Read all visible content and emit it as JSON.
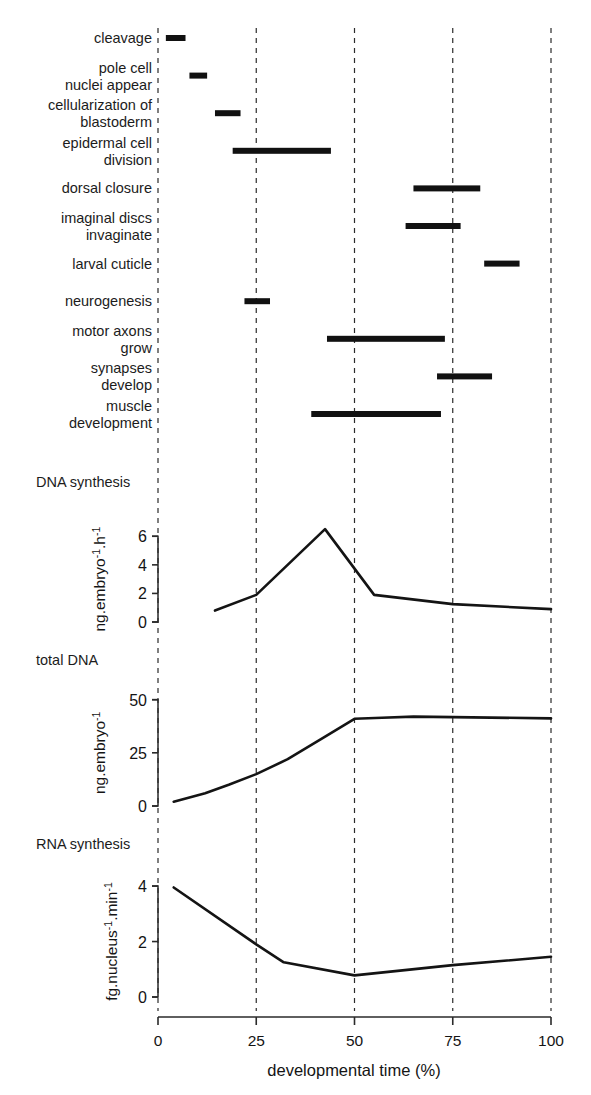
{
  "figure": {
    "x_axis": {
      "title": "developmental time (%)",
      "ticks": [
        "0",
        "25",
        "50",
        "75",
        "100"
      ],
      "tick_values": [
        0,
        25,
        50,
        75,
        100
      ],
      "range": [
        0,
        100
      ],
      "gridlines_at": [
        0,
        25,
        50,
        75,
        100
      ]
    }
  },
  "chart_data": [
    {
      "type": "table",
      "name": "developmental-events-timeline",
      "title": "",
      "xlabel": "developmental time (%)",
      "ylabel": "",
      "xlim": [
        0,
        100
      ],
      "grid": true,
      "columns": [
        "event",
        "start",
        "end"
      ],
      "events": [
        {
          "label": "cleavage",
          "lines": [
            "cleavage"
          ],
          "start": 2,
          "end": 7
        },
        {
          "label": "pole cell nuclei appear",
          "lines": [
            "pole cell",
            "nuclei appear"
          ],
          "start": 8,
          "end": 12.5
        },
        {
          "label": "cellularization of blastoderm",
          "lines": [
            "cellularization of",
            "blastoderm"
          ],
          "start": 14.5,
          "end": 21
        },
        {
          "label": "epidermal cell division",
          "lines": [
            "epidermal cell",
            "division"
          ],
          "start": 19,
          "end": 44
        },
        {
          "label": "dorsal closure",
          "lines": [
            "dorsal closure"
          ],
          "start": 65,
          "end": 82
        },
        {
          "label": "imaginal discs invaginate",
          "lines": [
            "imaginal discs",
            "invaginate"
          ],
          "start": 63,
          "end": 77
        },
        {
          "label": "larval cuticle",
          "lines": [
            "larval cuticle"
          ],
          "start": 83,
          "end": 92
        },
        {
          "label": "neurogenesis",
          "lines": [
            "neurogenesis"
          ],
          "start": 22,
          "end": 28.5
        },
        {
          "label": "motor axons grow",
          "lines": [
            "motor axons",
            "grow"
          ],
          "start": 43,
          "end": 73
        },
        {
          "label": "synapses develop",
          "lines": [
            "synapses",
            "develop"
          ],
          "start": 71,
          "end": 85
        },
        {
          "label": "muscle development",
          "lines": [
            "muscle",
            "development"
          ],
          "start": 39,
          "end": 72
        }
      ]
    },
    {
      "type": "line",
      "name": "dna-synthesis",
      "title": "DNA synthesis",
      "xlabel": "developmental time (%)",
      "ylabel": "ng.embryo-1.h-1",
      "ylabel_parts": [
        {
          "text": "ng.embryo",
          "sup": false
        },
        {
          "text": "-1",
          "sup": true
        },
        {
          "text": ".h",
          "sup": false
        },
        {
          "text": "-1",
          "sup": true
        }
      ],
      "ylim": [
        0,
        7
      ],
      "yticks": [
        0,
        2,
        4,
        6
      ],
      "ytick_labels": [
        "0",
        "2",
        "4",
        "6"
      ],
      "grid": true,
      "x": [
        14.5,
        25,
        42.5,
        55,
        75,
        100
      ],
      "values": [
        0.8,
        1.9,
        6.5,
        1.9,
        1.25,
        0.9
      ]
    },
    {
      "type": "line",
      "name": "total-dna",
      "title": "total DNA",
      "xlabel": "developmental time (%)",
      "ylabel": "ng.embryo-1",
      "ylabel_parts": [
        {
          "text": "ng.embryo",
          "sup": false
        },
        {
          "text": "-1",
          "sup": true
        }
      ],
      "ylim": [
        0,
        55
      ],
      "yticks": [
        0,
        25,
        50
      ],
      "ytick_labels": [
        "0",
        "25",
        "50"
      ],
      "grid": true,
      "x": [
        4,
        12,
        18,
        25,
        33,
        42,
        50,
        57,
        65,
        75,
        100
      ],
      "values": [
        2,
        6,
        10,
        15,
        22,
        32,
        41,
        41.5,
        42,
        41.8,
        41.2
      ]
    },
    {
      "type": "line",
      "name": "rna-synthesis",
      "title": "RNA synthesis",
      "xlabel": "developmental time (%)",
      "ylabel": "fg.nucleus-1.min-1",
      "ylabel_parts": [
        {
          "text": "fg.nucleus",
          "sup": false
        },
        {
          "text": "-1",
          "sup": true
        },
        {
          "text": ".min",
          "sup": false
        },
        {
          "text": "-1",
          "sup": true
        }
      ],
      "ylim": [
        0,
        4.4
      ],
      "yticks": [
        0,
        2,
        4
      ],
      "ytick_labels": [
        "0",
        "2",
        "4"
      ],
      "grid": true,
      "x": [
        4,
        25,
        32,
        50,
        75,
        100
      ],
      "values": [
        3.95,
        1.9,
        1.25,
        0.78,
        1.15,
        1.45
      ]
    }
  ]
}
